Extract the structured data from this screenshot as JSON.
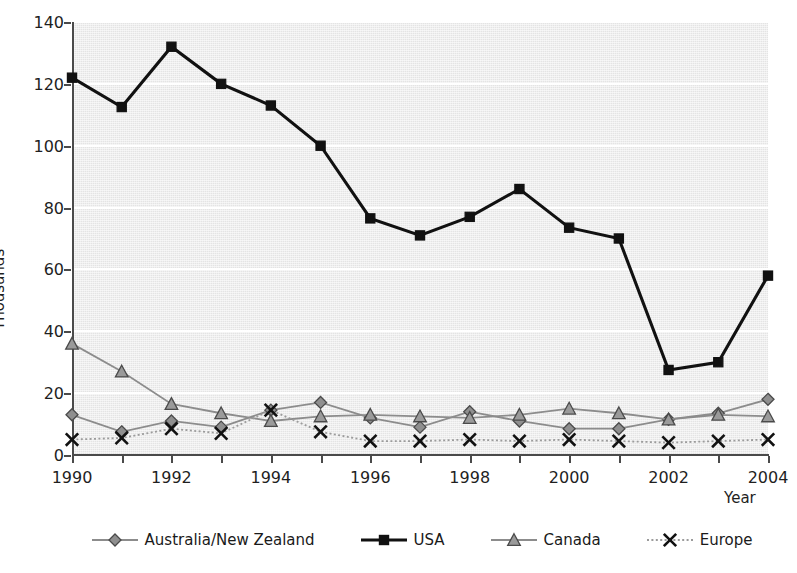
{
  "chart_data": {
    "type": "line",
    "title": "",
    "xlabel": "Year",
    "ylabel": "Thousands",
    "xlim": [
      1990,
      2004
    ],
    "ylim": [
      0,
      140
    ],
    "ytick_step": 20,
    "xtick_step": 1,
    "grid": "horizontal",
    "legend_position": "bottom",
    "plot_background": "#e4e4e4",
    "gridline_color": "#ffffff",
    "axis_color": "#4a4a4a",
    "x": [
      1990,
      1991,
      1992,
      1993,
      1994,
      1995,
      1996,
      1997,
      1998,
      1999,
      2000,
      2001,
      2002,
      2003,
      2004
    ],
    "xtick_labels": [
      "1990",
      "",
      "1992",
      "",
      "1994",
      "",
      "1996",
      "",
      "1998",
      "",
      "2000",
      "",
      "2002",
      "",
      "2004"
    ],
    "ytick_labels": [
      "0",
      "20",
      "40",
      "60",
      "80",
      "100",
      "120",
      "140"
    ],
    "ytick_values": [
      0,
      20,
      40,
      60,
      80,
      100,
      120,
      140
    ],
    "series": [
      {
        "name": "Australia/New Zealand",
        "marker": "diamond",
        "color": "#8c8c8c",
        "marker_fill": "#8f8f8f",
        "line_style": "solid",
        "values": [
          13,
          7.5,
          11,
          9,
          14.5,
          17,
          12,
          9,
          14,
          11,
          8.5,
          8.5,
          11.5,
          13.5,
          18
        ]
      },
      {
        "name": "USA",
        "marker": "square",
        "color": "#111111",
        "marker_fill": "#111111",
        "line_style": "solid",
        "values": [
          122,
          112.5,
          132,
          120,
          113,
          100,
          76.5,
          71,
          77,
          86,
          73.5,
          70,
          27.5,
          30,
          58
        ]
      },
      {
        "name": "Canada",
        "marker": "triangle",
        "color": "#8c8c8c",
        "marker_fill": "#9a9a9a",
        "line_style": "solid",
        "values": [
          36,
          27,
          16.5,
          13.5,
          11,
          12.5,
          13,
          12.5,
          12,
          13,
          15,
          13.5,
          11.5,
          13,
          12.5
        ]
      },
      {
        "name": "Europe",
        "marker": "x",
        "color": "#9b9b9b",
        "marker_fill": "#111111",
        "line_style": "dotted",
        "values": [
          5,
          5.5,
          8.5,
          7,
          14.5,
          7.5,
          4.5,
          4.5,
          5,
          4.5,
          5,
          4.5,
          4,
          4.5,
          5
        ]
      }
    ]
  },
  "legend": {
    "items": [
      {
        "label": "Australia/New Zealand"
      },
      {
        "label": "USA"
      },
      {
        "label": "Canada"
      },
      {
        "label": "Europe"
      }
    ]
  },
  "axes": {
    "y_title": "Thousands",
    "x_title": "Year"
  }
}
